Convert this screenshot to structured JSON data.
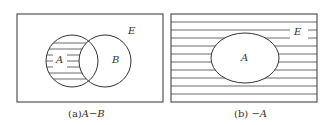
{
  "panels": [
    {
      "id": "a",
      "universe_label": "E",
      "set_labels": [
        "A",
        "B"
      ],
      "caption_prefix": "(a)",
      "caption_expr": "A−B",
      "shaded_region": "A minus B"
    },
    {
      "id": "b",
      "universe_label": "E",
      "set_labels": [
        "A"
      ],
      "caption_prefix": "(b)",
      "caption_expr": "−A",
      "shaded_region": "complement of A"
    }
  ],
  "colors": {
    "stroke": "#333333",
    "background": "#ffffff"
  }
}
